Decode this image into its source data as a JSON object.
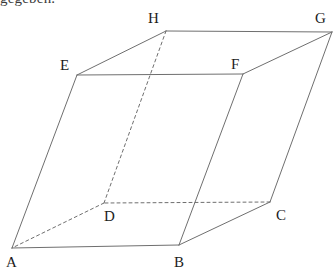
{
  "page": {
    "width": 334,
    "height": 277,
    "background_color": "#ffffff"
  },
  "clipped_text": {
    "content": "gegeben.",
    "note_visible": "only bottom sliver of glyphs visible at top-left"
  },
  "figure": {
    "kind": "parallelepiped",
    "title": "",
    "stroke_color": "#6f6f6f",
    "dashed_stroke_color": "#6f6f6f",
    "stroke_width": 1,
    "dash_pattern": "3 3",
    "label_color": "#1c1c1c",
    "vertices": [
      {
        "id": "A",
        "label": "A",
        "x": 12,
        "y": 248,
        "label_x": 6,
        "label_y": 255,
        "hidden": false
      },
      {
        "id": "B",
        "label": "B",
        "x": 179,
        "y": 245,
        "label_x": 174,
        "label_y": 255,
        "hidden": false
      },
      {
        "id": "C",
        "label": "C",
        "x": 270,
        "y": 202,
        "label_x": 276,
        "label_y": 208,
        "hidden": false
      },
      {
        "id": "D",
        "label": "D",
        "x": 104,
        "y": 203,
        "label_x": 104,
        "label_y": 209,
        "hidden": true
      },
      {
        "id": "E",
        "label": "E",
        "x": 77,
        "y": 75,
        "label_x": 60,
        "label_y": 58,
        "hidden": false
      },
      {
        "id": "F",
        "label": "F",
        "x": 243,
        "y": 74,
        "label_x": 231,
        "label_y": 57,
        "hidden": false
      },
      {
        "id": "G",
        "label": "G",
        "x": 332,
        "y": 32,
        "label_x": 315,
        "label_y": 11,
        "hidden": false
      },
      {
        "id": "H",
        "label": "H",
        "x": 166,
        "y": 31,
        "label_x": 148,
        "label_y": 11,
        "hidden": false
      }
    ],
    "edges": [
      {
        "from": "A",
        "to": "B",
        "style": "solid",
        "name": "edge-ab"
      },
      {
        "from": "B",
        "to": "C",
        "style": "solid",
        "name": "edge-bc"
      },
      {
        "from": "C",
        "to": "D",
        "style": "dashed",
        "name": "edge-cd"
      },
      {
        "from": "D",
        "to": "A",
        "style": "dashed",
        "name": "edge-da"
      },
      {
        "from": "E",
        "to": "F",
        "style": "solid",
        "name": "edge-ef"
      },
      {
        "from": "F",
        "to": "G",
        "style": "solid",
        "name": "edge-fg"
      },
      {
        "from": "G",
        "to": "H",
        "style": "solid",
        "name": "edge-gh"
      },
      {
        "from": "H",
        "to": "E",
        "style": "solid",
        "name": "edge-he"
      },
      {
        "from": "A",
        "to": "E",
        "style": "solid",
        "name": "edge-ae"
      },
      {
        "from": "B",
        "to": "F",
        "style": "solid",
        "name": "edge-bf"
      },
      {
        "from": "C",
        "to": "G",
        "style": "solid",
        "name": "edge-cg"
      },
      {
        "from": "D",
        "to": "H",
        "style": "dashed",
        "name": "edge-dh"
      }
    ]
  }
}
